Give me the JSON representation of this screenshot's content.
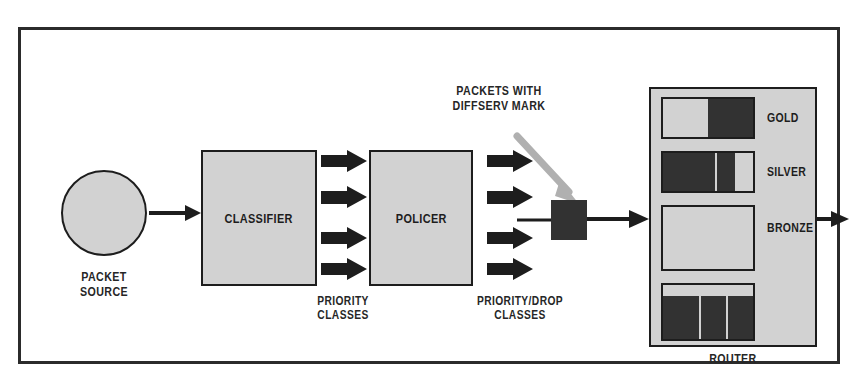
{
  "diagram": {
    "frame": {
      "border_color": "#2b2b2b"
    },
    "palette": {
      "box_fill": "#d2d2d2",
      "box_stroke": "#1d1d1d",
      "packet_dark": "#323232",
      "arrow_dark": "#1d1d1d",
      "callout_arrow_gray": "#aaaaaa",
      "text": "#262626",
      "background": "#ffffff"
    },
    "nodes": {
      "packet_source": {
        "label": "PACKET\nSOURCE",
        "shape": "circle"
      },
      "classifier": {
        "label": "CLASSIFIER",
        "shape": "rect"
      },
      "policer": {
        "label": "POLICER",
        "shape": "rect"
      },
      "router": {
        "label": "ROUTER",
        "shape": "rect"
      },
      "diffserv_packet": {
        "label": "",
        "shape": "square-filled"
      }
    },
    "flow_labels": {
      "priority_classes": "PRIORITY\nCLASSES",
      "priority_drop_classes": "PRIORITY/DROP\nCLASSES"
    },
    "callout": {
      "text": "PACKETS WITH\nDIFFSERV MARK",
      "arrow_color": "#aaaaaa",
      "points_to": "diffserv_packet"
    },
    "arrow_groups": {
      "source_to_classifier": {
        "count": 1,
        "direction": "right"
      },
      "classifier_to_policer": {
        "count": 4,
        "direction": "right"
      },
      "policer_to_mark": {
        "count": 4,
        "direction": "right"
      },
      "mark_to_router": {
        "count": 1,
        "direction": "right"
      },
      "router_egress": {
        "count": 1,
        "direction": "right"
      }
    },
    "router_queues": [
      {
        "name": "GOLD",
        "fill_percent": 55,
        "packets": 1,
        "segments": [
          55
        ]
      },
      {
        "name": "SILVER",
        "fill_percent": 80,
        "packets": 2,
        "segments": [
          55,
          25
        ]
      },
      {
        "name": "BRONZE",
        "fill_percent": 0,
        "packets": 0,
        "segments": []
      },
      {
        "name": "",
        "fill_percent": 100,
        "packets": 3,
        "segments": [
          40,
          30,
          30
        ]
      }
    ]
  }
}
